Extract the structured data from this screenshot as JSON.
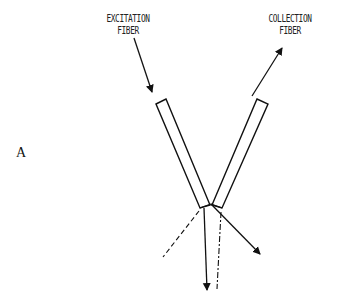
{
  "panel_label": "A",
  "labels": {
    "excitation": {
      "line1": "EXCITATION",
      "line2": "FIBER"
    },
    "collection": {
      "line1": "COLLECTION",
      "line2": "FIBER"
    }
  },
  "elements": {
    "fibers": [
      "excitation-fiber",
      "collection-fiber"
    ],
    "arrows": [
      "excitation-input-arrow",
      "collection-output-arrow",
      "transmitted-arrow",
      "scattered-arrow"
    ],
    "dashed_lines": [
      "left-dashed-ray",
      "right-dashdot-ray"
    ]
  },
  "colors": {
    "stroke": "#111111",
    "background": "#ffffff"
  }
}
